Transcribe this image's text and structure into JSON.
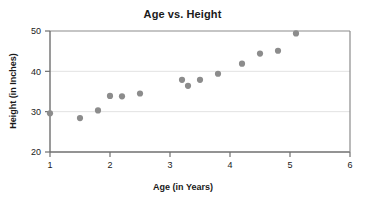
{
  "chart_data": {
    "type": "scatter",
    "title": "Age vs. Height",
    "xlabel": "Age (in Years)",
    "ylabel": "Height (in Inches)",
    "xlim": [
      1,
      6
    ],
    "ylim": [
      20,
      50
    ],
    "xticks": [
      1,
      2,
      3,
      4,
      5,
      6
    ],
    "yticks": [
      20,
      30,
      40,
      50
    ],
    "xtick_labels": [
      "1",
      "2",
      "3",
      "4",
      "5",
      "6"
    ],
    "ytick_labels": [
      "20",
      "30",
      "40",
      "50"
    ],
    "grid": "horizontal",
    "legend": "none",
    "marker_color": "#8c8c8c",
    "marker_size": 5,
    "points": [
      {
        "x": 1.0,
        "y": 29.6
      },
      {
        "x": 1.5,
        "y": 28.4
      },
      {
        "x": 1.8,
        "y": 30.3
      },
      {
        "x": 2.0,
        "y": 33.9
      },
      {
        "x": 2.2,
        "y": 33.8
      },
      {
        "x": 2.5,
        "y": 34.5
      },
      {
        "x": 3.2,
        "y": 37.9
      },
      {
        "x": 3.3,
        "y": 36.4
      },
      {
        "x": 3.5,
        "y": 37.9
      },
      {
        "x": 3.8,
        "y": 39.4
      },
      {
        "x": 4.2,
        "y": 41.9
      },
      {
        "x": 4.5,
        "y": 44.4
      },
      {
        "x": 4.8,
        "y": 45.1
      },
      {
        "x": 5.1,
        "y": 49.4
      }
    ]
  },
  "chart": {
    "title": "Age vs. Height",
    "xlabel": "Age (in Years)",
    "ylabel": "Height (in Inches)"
  }
}
